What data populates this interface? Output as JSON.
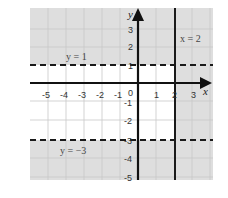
{
  "graph": {
    "x_range": [
      -6,
      3.5
    ],
    "y_range": [
      -5,
      3.5
    ],
    "x_tick_labels": [
      "-5",
      "-4",
      "-3",
      "-2",
      "-1",
      "0",
      "1",
      "2",
      "3"
    ],
    "y_tick_labels": [
      "3",
      "2",
      "1",
      "-1",
      "-2",
      "-3",
      "-4",
      "-5"
    ],
    "axis_labels": {
      "x": "x",
      "y": "y"
    },
    "lines": [
      {
        "equation": "y = 1",
        "style": "dashed",
        "orientation": "horizontal",
        "value": 1
      },
      {
        "equation": "y = −3",
        "style": "dashed",
        "orientation": "horizontal",
        "value": -3
      },
      {
        "equation": "x = 2",
        "style": "solid",
        "orientation": "vertical",
        "value": 2
      }
    ],
    "shading": {
      "description": "Shaded region is outside the unshaded band -3 < y < 1, x < 2",
      "shaded_color": "#dedede",
      "unshaded_color": "#ffffff"
    },
    "colors": {
      "grid": "#c8c8c8",
      "axes": "#111111",
      "lines": "#1a1a1a"
    }
  }
}
